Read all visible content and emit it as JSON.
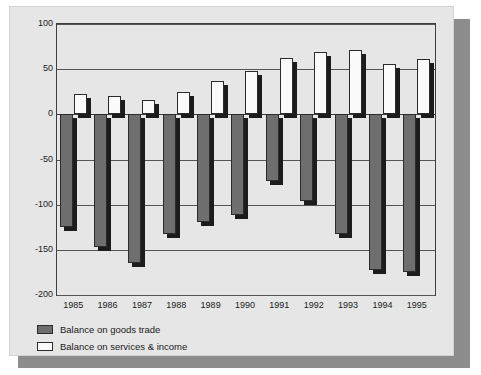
{
  "chart_data": {
    "type": "bar",
    "title": "",
    "subtitle": "",
    "xlabel": "",
    "ylabel": "",
    "categories": [
      "1985",
      "1986",
      "1987",
      "1988",
      "1989",
      "1990",
      "1991",
      "1992",
      "1993",
      "1994",
      "1995"
    ],
    "series": [
      {
        "name": "Balance on goods trade",
        "color": "#6e6e6e",
        "values": [
          -125,
          -147,
          -165,
          -132,
          -119,
          -111,
          -74,
          -96,
          -132,
          -172,
          -175
        ]
      },
      {
        "name": "Balance on services & income",
        "color": "#fafafa",
        "values": [
          23,
          20,
          16,
          25,
          37,
          48,
          62,
          69,
          71,
          56,
          61
        ]
      }
    ],
    "ylim": [
      -200,
      100
    ],
    "yticks": [
      100,
      50,
      0,
      -50,
      -100,
      -150,
      -200
    ],
    "ytick_labels": [
      "100",
      "50",
      "0",
      "-50",
      "-100",
      "-150",
      "-200"
    ],
    "grid": true,
    "legend_position": "bottom-left"
  },
  "legend": {
    "items": [
      {
        "label": "Balance on goods trade",
        "swatch": "goods"
      },
      {
        "label": "Balance on services & income",
        "swatch": "services"
      }
    ]
  }
}
